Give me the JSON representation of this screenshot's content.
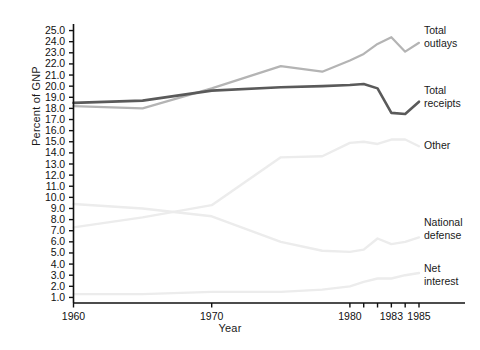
{
  "chart_data": {
    "type": "line",
    "title": "",
    "xlabel": "Year",
    "ylabel": "Percent of GNP",
    "xlim": [
      1960,
      1985
    ],
    "ylim": [
      0.5,
      25.5
    ],
    "grid": false,
    "legend_position": "right-inline-labels",
    "ytick_labels": [
      "25.0",
      "24.0",
      "23.0",
      "22.0",
      "21.0",
      "20.0",
      "19.0",
      "18.0",
      "17.0",
      "16.0",
      "15.0",
      "14.0",
      "13.0",
      "12.0",
      "11.0",
      "10.0",
      "9.0",
      "8.0",
      "7.0",
      "6.0",
      "5.0",
      "4.0",
      "3.0",
      "2.0",
      "1.0"
    ],
    "ytick_values": [
      25,
      24,
      23,
      22,
      21,
      20,
      19,
      18,
      17,
      16,
      15,
      14,
      13,
      12,
      11,
      10,
      9,
      8,
      7,
      6,
      5,
      4,
      3,
      2,
      1
    ],
    "xtick_labels": [
      "1960",
      "1970",
      "1980",
      "1983",
      "1985"
    ],
    "xtick_values": [
      1960,
      1970,
      1980,
      1983,
      1985
    ],
    "xtick_minor_values": [
      1981,
      1982,
      1984
    ],
    "series": [
      {
        "name": "Total outlays",
        "label": "Total\noutlays",
        "label_line1": "Total",
        "label_line2": "outlays",
        "color": "#b4b4b4",
        "x": [
          1960,
          1965,
          1970,
          1975,
          1978,
          1980,
          1981,
          1982,
          1983,
          1984,
          1985
        ],
        "values": [
          18.2,
          18.0,
          19.8,
          21.8,
          21.3,
          22.3,
          22.9,
          23.8,
          24.4,
          23.1,
          23.9
        ]
      },
      {
        "name": "Total receipts",
        "label": "Total\nreceipts",
        "label_line1": "Total",
        "label_line2": "receipts",
        "color": "#5a5a5a",
        "x": [
          1960,
          1965,
          1970,
          1975,
          1978,
          1980,
          1981,
          1982,
          1983,
          1984,
          1985
        ],
        "values": [
          18.5,
          18.7,
          19.6,
          19.9,
          20.0,
          20.1,
          20.2,
          19.8,
          17.6,
          17.5,
          18.6
        ]
      },
      {
        "name": "Other",
        "label": "Other",
        "label_line1": "Other",
        "label_line2": "",
        "color": "#ececec",
        "x": [
          1960,
          1965,
          1970,
          1975,
          1978,
          1980,
          1981,
          1982,
          1983,
          1984,
          1985
        ],
        "values": [
          7.3,
          8.2,
          9.3,
          13.6,
          13.7,
          14.9,
          15.0,
          14.8,
          15.2,
          15.2,
          14.6
        ]
      },
      {
        "name": "National defense",
        "label": "National\ndefense",
        "label_line1": "National",
        "label_line2": "defense",
        "color": "#ececec",
        "x": [
          1960,
          1965,
          1970,
          1975,
          1978,
          1980,
          1981,
          1982,
          1983,
          1984,
          1985
        ],
        "values": [
          9.4,
          9.0,
          8.3,
          6.0,
          5.2,
          5.1,
          5.3,
          6.3,
          5.8,
          6.0,
          6.4
        ]
      },
      {
        "name": "Net interest",
        "label": "Net\ninterest",
        "label_line1": "Net",
        "label_line2": "interest",
        "color": "#ececec",
        "x": [
          1960,
          1965,
          1970,
          1975,
          1978,
          1980,
          1981,
          1982,
          1983,
          1984,
          1985
        ],
        "values": [
          1.3,
          1.3,
          1.5,
          1.5,
          1.7,
          2.0,
          2.4,
          2.7,
          2.7,
          3.0,
          3.2
        ]
      }
    ]
  }
}
